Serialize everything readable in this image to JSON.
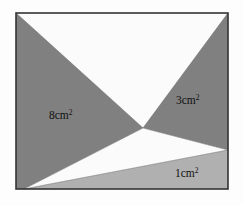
{
  "figure": {
    "background_color": "#fdfdfd",
    "border_color": "#333333",
    "colors": {
      "shaded_dark": "#808080",
      "shaded_light": "#b0b0b0",
      "unshaded": "#fbfbfb",
      "outline": "#333333"
    },
    "frame": {
      "left": 16,
      "top": 13,
      "right": 228,
      "bottom": 189
    },
    "interior_point": {
      "x": 143,
      "y": 128
    },
    "regions": [
      {
        "id": "left-region",
        "label": "8cm",
        "exponent": "2",
        "fill": "shaded_dark",
        "label_x": 49,
        "label_y": 119
      },
      {
        "id": "right-region",
        "label": "3cm",
        "exponent": "2",
        "fill": "shaded_dark",
        "label_x": 176,
        "label_y": 104
      },
      {
        "id": "bottom-region",
        "label": "1cm",
        "exponent": "2",
        "fill": "shaded_light",
        "label_x": 175,
        "label_y": 177
      },
      {
        "id": "top-region",
        "label": "",
        "exponent": "",
        "fill": "unshaded",
        "label_x": 0,
        "label_y": 0
      }
    ]
  }
}
